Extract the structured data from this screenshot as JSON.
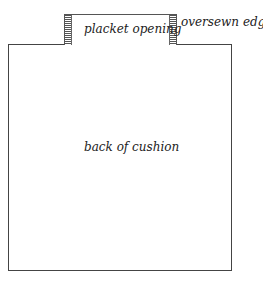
{
  "diagram": {
    "labels": {
      "placket": "placket opening",
      "edges": "oversewn edges",
      "back": "back of cushion"
    }
  }
}
